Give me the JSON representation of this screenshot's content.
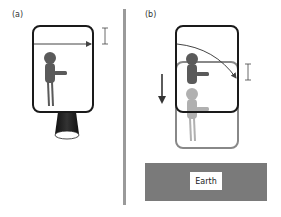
{
  "panels": {
    "a": {
      "label": "(a)"
    },
    "b": {
      "label": "(b)",
      "earth_label": "Earth"
    }
  },
  "colors": {
    "box_dark": "#1a1a1a",
    "box_light": "#888888",
    "person_dark": "#5a5a5a",
    "person_light": "#b0b0b0",
    "divider": "#9a9a9a",
    "earth": "#7a7a7a",
    "thruster": "#1a1a1a"
  }
}
